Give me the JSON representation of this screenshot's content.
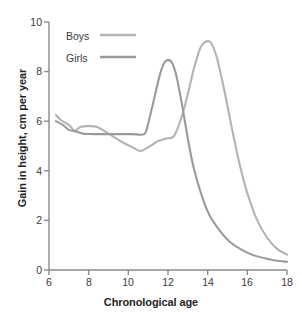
{
  "chart_data": {
    "type": "line",
    "title": "",
    "xlabel": "Chronological age",
    "ylabel": "Gain in height, cm per year",
    "xlim": [
      6,
      18
    ],
    "ylim": [
      0,
      10
    ],
    "xticks": [
      "6",
      "8",
      "10",
      "12",
      "14",
      "16",
      "18"
    ],
    "yticks": [
      "0",
      "2",
      "4",
      "6",
      "8",
      "10"
    ],
    "grid": false,
    "legend_position": "top-left",
    "legend": [
      {
        "name": "Boys",
        "color": "#b3b3b3"
      },
      {
        "name": "Girls",
        "color": "#9a9a9a"
      }
    ],
    "series": [
      {
        "name": "Boys",
        "color": "#b3b3b3",
        "points": [
          [
            6.35,
            6.25
          ],
          [
            6.6,
            6.05
          ],
          [
            7.0,
            5.85
          ],
          [
            7.3,
            5.62
          ],
          [
            7.6,
            5.78
          ],
          [
            8.0,
            5.8
          ],
          [
            8.4,
            5.78
          ],
          [
            8.8,
            5.6
          ],
          [
            9.2,
            5.4
          ],
          [
            9.7,
            5.15
          ],
          [
            10.2,
            4.95
          ],
          [
            10.6,
            4.8
          ],
          [
            11.0,
            4.95
          ],
          [
            11.5,
            5.2
          ],
          [
            11.9,
            5.3
          ],
          [
            12.3,
            5.4
          ],
          [
            12.7,
            6.2
          ],
          [
            13.0,
            7.1
          ],
          [
            13.3,
            8.1
          ],
          [
            13.6,
            8.9
          ],
          [
            13.85,
            9.18
          ],
          [
            14.15,
            9.18
          ],
          [
            14.45,
            8.6
          ],
          [
            14.8,
            7.4
          ],
          [
            15.2,
            5.8
          ],
          [
            15.6,
            4.3
          ],
          [
            16.0,
            3.1
          ],
          [
            16.5,
            2.0
          ],
          [
            17.0,
            1.3
          ],
          [
            17.5,
            0.85
          ],
          [
            18.0,
            0.62
          ]
        ]
      },
      {
        "name": "Girls",
        "color": "#9a9a9a",
        "points": [
          [
            6.35,
            6.0
          ],
          [
            6.7,
            5.85
          ],
          [
            7.0,
            5.65
          ],
          [
            7.3,
            5.6
          ],
          [
            7.7,
            5.5
          ],
          [
            8.2,
            5.48
          ],
          [
            8.8,
            5.48
          ],
          [
            9.5,
            5.48
          ],
          [
            10.2,
            5.48
          ],
          [
            10.8,
            5.48
          ],
          [
            11.0,
            5.9
          ],
          [
            11.3,
            6.9
          ],
          [
            11.6,
            7.9
          ],
          [
            11.85,
            8.4
          ],
          [
            12.15,
            8.42
          ],
          [
            12.4,
            7.9
          ],
          [
            12.7,
            6.7
          ],
          [
            13.0,
            5.3
          ],
          [
            13.3,
            4.1
          ],
          [
            13.7,
            3.0
          ],
          [
            14.1,
            2.2
          ],
          [
            14.6,
            1.6
          ],
          [
            15.1,
            1.15
          ],
          [
            15.7,
            0.82
          ],
          [
            16.3,
            0.6
          ],
          [
            17.0,
            0.45
          ],
          [
            17.5,
            0.37
          ],
          [
            18.0,
            0.33
          ]
        ]
      }
    ]
  },
  "axis": {
    "color": "#8a8a8a"
  }
}
